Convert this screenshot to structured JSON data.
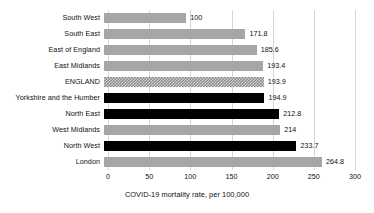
{
  "chart_data": {
    "type": "bar",
    "orientation": "horizontal",
    "title": "",
    "xlabel": "COVID-19 mortality rate, per 100,000",
    "ylabel": "",
    "xlim": [
      0,
      300
    ],
    "xticks": [
      0,
      50,
      100,
      150,
      200,
      250,
      300
    ],
    "xtick_labels": [
      "0",
      "50",
      "100",
      "150",
      "200",
      "250",
      "300"
    ],
    "grid": true,
    "grid_axis": "x",
    "legend": false,
    "categories": [
      "South West",
      "South East",
      "East of England",
      "East Midlands",
      "ENGLAND",
      "Yorkshire and the Humber",
      "North East",
      "West Midlands",
      "North West",
      "London"
    ],
    "values": [
      100,
      171.8,
      185.6,
      193.4,
      193.9,
      194.9,
      212.8,
      214,
      233.7,
      264.8
    ],
    "value_labels": [
      "100",
      "171.8",
      "185.6",
      "193.4",
      "193.9",
      "194.9",
      "212.8",
      "214",
      "233.7",
      "264.8"
    ],
    "bar_styles": [
      "grey",
      "grey",
      "grey",
      "grey",
      "dither",
      "black",
      "black",
      "grey",
      "black",
      "grey"
    ],
    "colors": {
      "grey": "#a6a6a6",
      "black": "#000000",
      "dither": "#8f8f8f",
      "gridline": "#d5d5d5",
      "text": "#111111",
      "background": "#ffffff"
    },
    "bars": [
      {
        "category": "South West",
        "value": 100,
        "label": "100",
        "style": "grey"
      },
      {
        "category": "South East",
        "value": 171.8,
        "label": "171.8",
        "style": "grey"
      },
      {
        "category": "East of England",
        "value": 185.6,
        "label": "185.6",
        "style": "grey"
      },
      {
        "category": "East Midlands",
        "value": 193.4,
        "label": "193.4",
        "style": "grey"
      },
      {
        "category": "ENGLAND",
        "value": 193.9,
        "label": "193.9",
        "style": "dither"
      },
      {
        "category": "Yorkshire and the Humber",
        "value": 194.9,
        "label": "194.9",
        "style": "black"
      },
      {
        "category": "North East",
        "value": 212.8,
        "label": "212.8",
        "style": "black"
      },
      {
        "category": "West Midlands",
        "value": 214,
        "label": "214",
        "style": "grey"
      },
      {
        "category": "North West",
        "value": 233.7,
        "label": "233.7",
        "style": "black"
      },
      {
        "category": "London",
        "value": 264.8,
        "label": "264.8",
        "style": "grey"
      }
    ]
  }
}
